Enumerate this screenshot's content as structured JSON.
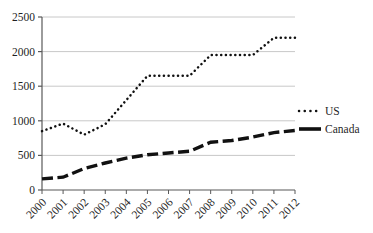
{
  "chart_data": {
    "type": "line",
    "title": "",
    "xlabel": "",
    "ylabel": "",
    "categories": [
      "2000",
      "2001",
      "2002",
      "2003",
      "2004",
      "2005",
      "2006",
      "2007",
      "2008",
      "2009",
      "2010",
      "2011",
      "2012"
    ],
    "series": [
      {
        "name": "US",
        "line_style": "dotted",
        "color": "#111111",
        "values": [
          850,
          960,
          800,
          950,
          1300,
          1650,
          1650,
          1650,
          1950,
          1950,
          1950,
          2200,
          2200
        ]
      },
      {
        "name": "Canada",
        "line_style": "dashed",
        "color": "#111111",
        "values": [
          160,
          185,
          310,
          390,
          460,
          510,
          535,
          560,
          690,
          715,
          765,
          830,
          860
        ]
      }
    ],
    "ylim": [
      0,
      2500
    ],
    "ytick_interval": 500,
    "ytick_labels": [
      "0",
      "500",
      "1000",
      "1500",
      "2000",
      "2500"
    ],
    "grid": "horizontal",
    "legend_position": "right",
    "legend_labels": [
      "US",
      "Canada"
    ],
    "colors": {
      "gridline": "#c8c8c8",
      "axis": "#595959",
      "text": "#1f1f1f",
      "background": "#ffffff"
    }
  }
}
